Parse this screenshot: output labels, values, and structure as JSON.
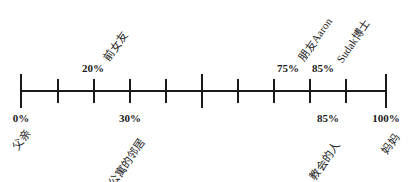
{
  "diagram": {
    "type": "number-line",
    "axis": {
      "min_label": "0%",
      "max_label": "100%",
      "tick_count": 11
    },
    "above": [
      {
        "percent": "20%",
        "label": "前女友",
        "x": 93
      },
      {
        "percent": "75%",
        "label": "朋友Aaron",
        "x": 288
      },
      {
        "percent": "85%",
        "label": "Sudak博士",
        "x": 323
      }
    ],
    "below": [
      {
        "percent": "0%",
        "label": "父亲",
        "x": 21
      },
      {
        "percent": "30%",
        "label": "公寓的邻居",
        "x": 130
      },
      {
        "percent": "85%",
        "label": "教会的人",
        "x": 328
      },
      {
        "percent": "100%",
        "label": "妈妈",
        "x": 386
      }
    ]
  }
}
